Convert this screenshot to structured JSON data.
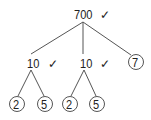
{
  "diagram": {
    "type": "factor-tree",
    "root": {
      "value": "700",
      "checked": true,
      "check_glyph": "✓"
    },
    "level1": [
      {
        "value": "10",
        "checked": true,
        "circled": false
      },
      {
        "value": "10",
        "checked": true,
        "circled": false
      },
      {
        "value": "7",
        "checked": false,
        "circled": true
      }
    ],
    "level2": [
      {
        "value": "2",
        "parent": 0,
        "circled": true
      },
      {
        "value": "5",
        "parent": 0,
        "circled": true
      },
      {
        "value": "2",
        "parent": 1,
        "circled": true
      },
      {
        "value": "5",
        "parent": 1,
        "circled": true
      }
    ],
    "colors": {
      "line": "#555555",
      "text": "#222222"
    }
  }
}
